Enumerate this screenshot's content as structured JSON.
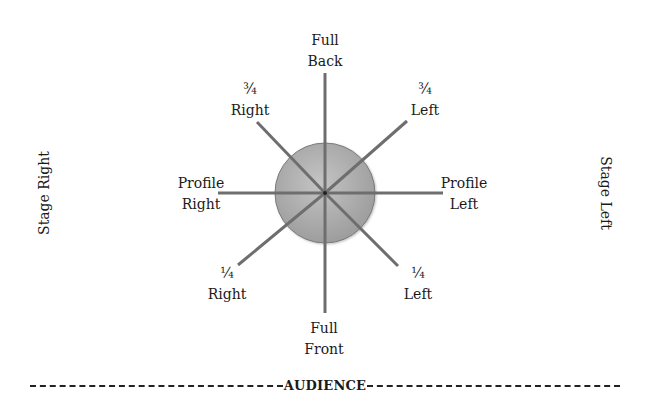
{
  "diagram": {
    "center": {
      "x": 325,
      "y": 193
    },
    "circle": {
      "radius": 50,
      "fill_light": "#c4c4c4",
      "fill_dark": "#9a9a9a",
      "stroke": "#7a7a7a"
    },
    "line_color": "#6e6e6e",
    "positions": [
      {
        "id": "full-back",
        "line1": "Full",
        "line2": "Back",
        "x2": 325,
        "y2": 73,
        "label_x": 325,
        "label_y": 30
      },
      {
        "id": "three-quarter-left",
        "line1": "¾",
        "line2": "Left",
        "x2": 407,
        "y2": 121,
        "label_x": 425,
        "label_y": 79
      },
      {
        "id": "profile-left",
        "line1": "Profile",
        "line2": "Left",
        "x2": 443,
        "y2": 193,
        "label_x": 464,
        "label_y": 173
      },
      {
        "id": "quarter-left",
        "line1": "¼",
        "line2": "Left",
        "x2": 398,
        "y2": 266,
        "label_x": 418,
        "label_y": 263
      },
      {
        "id": "full-front",
        "line1": "Full",
        "line2": "Front",
        "x2": 325,
        "y2": 313,
        "label_x": 324,
        "label_y": 318
      },
      {
        "id": "quarter-right",
        "line1": "¼",
        "line2": "Right",
        "x2": 238,
        "y2": 265,
        "label_x": 227,
        "label_y": 263
      },
      {
        "id": "profile-right",
        "line1": "Profile",
        "line2": "Right",
        "x2": 218,
        "y2": 193,
        "label_x": 201,
        "label_y": 173
      },
      {
        "id": "three-quarter-right",
        "line1": "¾",
        "line2": "Right",
        "x2": 257,
        "y2": 122,
        "label_x": 250,
        "label_y": 79
      }
    ],
    "stage_right": "Stage Right",
    "stage_left": "Stage Left",
    "audience": "AUDIENCE"
  }
}
